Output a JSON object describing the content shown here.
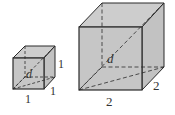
{
  "figure": {
    "colors": {
      "face": "#c4c4c4",
      "face_light": "#cfcfcf",
      "edge": "#2b2b2b",
      "label": "#333333"
    },
    "small_cube": {
      "diagonal_label": "d",
      "height_label": "1",
      "depth_label": "1",
      "width_label": "1"
    },
    "large_cube": {
      "diagonal_label": "d",
      "depth_label": "2",
      "width_label": "2"
    }
  }
}
